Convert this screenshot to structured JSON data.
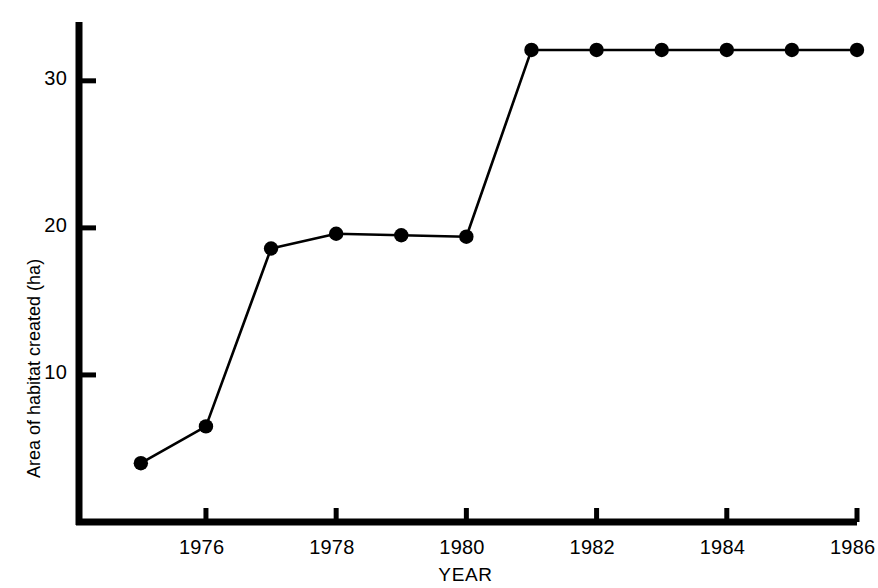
{
  "chart_data": {
    "type": "line",
    "title": "",
    "subtitle": "",
    "xlabel": "YEAR",
    "ylabel": "Area of habitat created (ha)",
    "x": [
      1975,
      1976,
      1977,
      1978,
      1979,
      1980,
      1981,
      1982,
      1983,
      1984,
      1985,
      1986
    ],
    "values": [
      4.0,
      6.5,
      18.6,
      19.6,
      19.5,
      19.4,
      32.1,
      32.1,
      32.1,
      32.1,
      32.1,
      32.1
    ],
    "series": [
      {
        "name": "Area of habitat created",
        "values": [
          4.0,
          6.5,
          18.6,
          19.6,
          19.5,
          19.4,
          32.1,
          32.1,
          32.1,
          32.1,
          32.1,
          32.1
        ]
      }
    ],
    "xlim": [
      1974.05,
      1986.0
    ],
    "ylim": [
      0,
      34.0
    ],
    "x_ticks": [
      1976,
      1978,
      1980,
      1982,
      1984,
      1986
    ],
    "x_tick_labels": [
      "1976",
      "1978",
      "1980",
      "1982",
      "1984",
      "1986"
    ],
    "y_ticks": [
      10,
      20,
      30
    ],
    "y_tick_labels": [
      "10",
      "20",
      "30"
    ],
    "grid": false,
    "legend": null,
    "legend_position": "none",
    "marker": "filled-circle",
    "line_color": "#000000",
    "marker_color": "#000000",
    "background_color": "#ffffff",
    "axis_color": "#000000",
    "annotations": []
  },
  "axes": {
    "y_axis_name": "y-axis",
    "x_axis_name": "x-axis"
  }
}
